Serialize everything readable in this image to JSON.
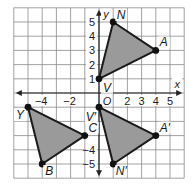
{
  "diagram": {
    "type": "coordinate-plane-transformation",
    "axes": {
      "x_label": "x",
      "y_label": "y",
      "origin_label": "O",
      "x_range": [
        -6,
        6
      ],
      "y_range": [
        -6,
        6
      ],
      "x_ticks": [
        {
          "value": -4,
          "label": "−4"
        },
        {
          "value": -2,
          "label": "−2"
        },
        {
          "value": 2,
          "label": "2"
        },
        {
          "value": 3,
          "label": "3"
        },
        {
          "value": 4,
          "label": "4"
        },
        {
          "value": 5,
          "label": "5"
        }
      ],
      "y_ticks": [
        {
          "value": 5,
          "label": "5"
        },
        {
          "value": 4,
          "label": "4"
        },
        {
          "value": 3,
          "label": "3"
        },
        {
          "value": 2,
          "label": "2"
        },
        {
          "value": 1,
          "label": "1"
        },
        {
          "value": -4,
          "label": "−4"
        },
        {
          "value": -5,
          "label": "−5"
        }
      ]
    },
    "colors": {
      "grid": "#8a8a8a",
      "axis": "#222222",
      "fill": "#9a9a9a",
      "edge": "#1a1a1a",
      "vertex": "#111111"
    },
    "triangles": [
      {
        "name": "VNA",
        "vertices": [
          {
            "label": "V",
            "x": 0,
            "y": 1
          },
          {
            "label": "N",
            "x": 1,
            "y": 5
          },
          {
            "label": "A",
            "x": 4,
            "y": 3
          }
        ]
      },
      {
        "name": "V'N'A'",
        "vertices": [
          {
            "label": "V′",
            "x": 0,
            "y": -1
          },
          {
            "label": "N′",
            "x": 1,
            "y": -5
          },
          {
            "label": "A′",
            "x": 4,
            "y": -3
          }
        ]
      },
      {
        "name": "YBC",
        "vertices": [
          {
            "label": "Y",
            "x": -5,
            "y": -1
          },
          {
            "label": "B",
            "x": -4,
            "y": -5
          },
          {
            "label": "C",
            "x": -1,
            "y": -3
          }
        ]
      }
    ]
  }
}
